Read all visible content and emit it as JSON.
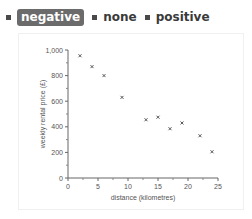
{
  "legend": {
    "options": [
      {
        "label": "negative",
        "selected": true
      },
      {
        "label": "none",
        "selected": false
      },
      {
        "label": "positive",
        "selected": false
      }
    ]
  },
  "chart_data": {
    "type": "scatter",
    "title": "",
    "xlabel": "distance (kilometres)",
    "ylabel": "weekly rental price (£)",
    "xlim": [
      0,
      25
    ],
    "ylim": [
      0,
      1000
    ],
    "xticks": [
      "0",
      "5",
      "10",
      "15",
      "20",
      "25"
    ],
    "yticks": [
      "0",
      "200",
      "400",
      "600",
      "800",
      "1,000"
    ],
    "grid": false,
    "marker": "x",
    "x": [
      2,
      4,
      6,
      9,
      13,
      15,
      17,
      19,
      22,
      24
    ],
    "y": [
      955,
      870,
      800,
      630,
      455,
      475,
      385,
      430,
      330,
      205
    ]
  }
}
